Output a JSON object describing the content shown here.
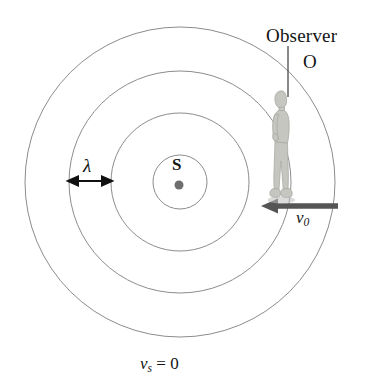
{
  "figure": {
    "labels": {
      "observer": "Observer",
      "observer_point": "O",
      "source_point": "S",
      "wavelength": "λ",
      "observer_velocity_symbol": "v",
      "observer_velocity_subscript": "0",
      "source_velocity_symbol": "v",
      "source_velocity_subscript": "s",
      "source_velocity_equals": " = 0"
    },
    "colors": {
      "background": "#ffffff",
      "wavefront_stroke": "#8c8c8c",
      "text": "#141414",
      "velocity_arrow": "#555555",
      "source_dot": "#6e6e6e",
      "lambda_arrow": "#111111",
      "leader_line": "#4a4a4a",
      "person_sketch": "#b9b9b4"
    },
    "geometry": {
      "center_x": 180,
      "center_y": 182,
      "wavefront_radii": [
        27,
        69,
        111,
        155
      ],
      "wavefront_count": 4,
      "source_dot_radius": 4.5
    },
    "annotations": {
      "wavelength_span_start_x": 68,
      "wavelength_span_end_x": 111,
      "wavelength_arrow_y": 181,
      "velocity_arrow_start_x": 338,
      "velocity_arrow_end_x": 262,
      "velocity_arrow_y": 206,
      "leader_line_top_y": 46,
      "leader_line_bottom_y": 97,
      "leader_line_x": 288
    }
  }
}
